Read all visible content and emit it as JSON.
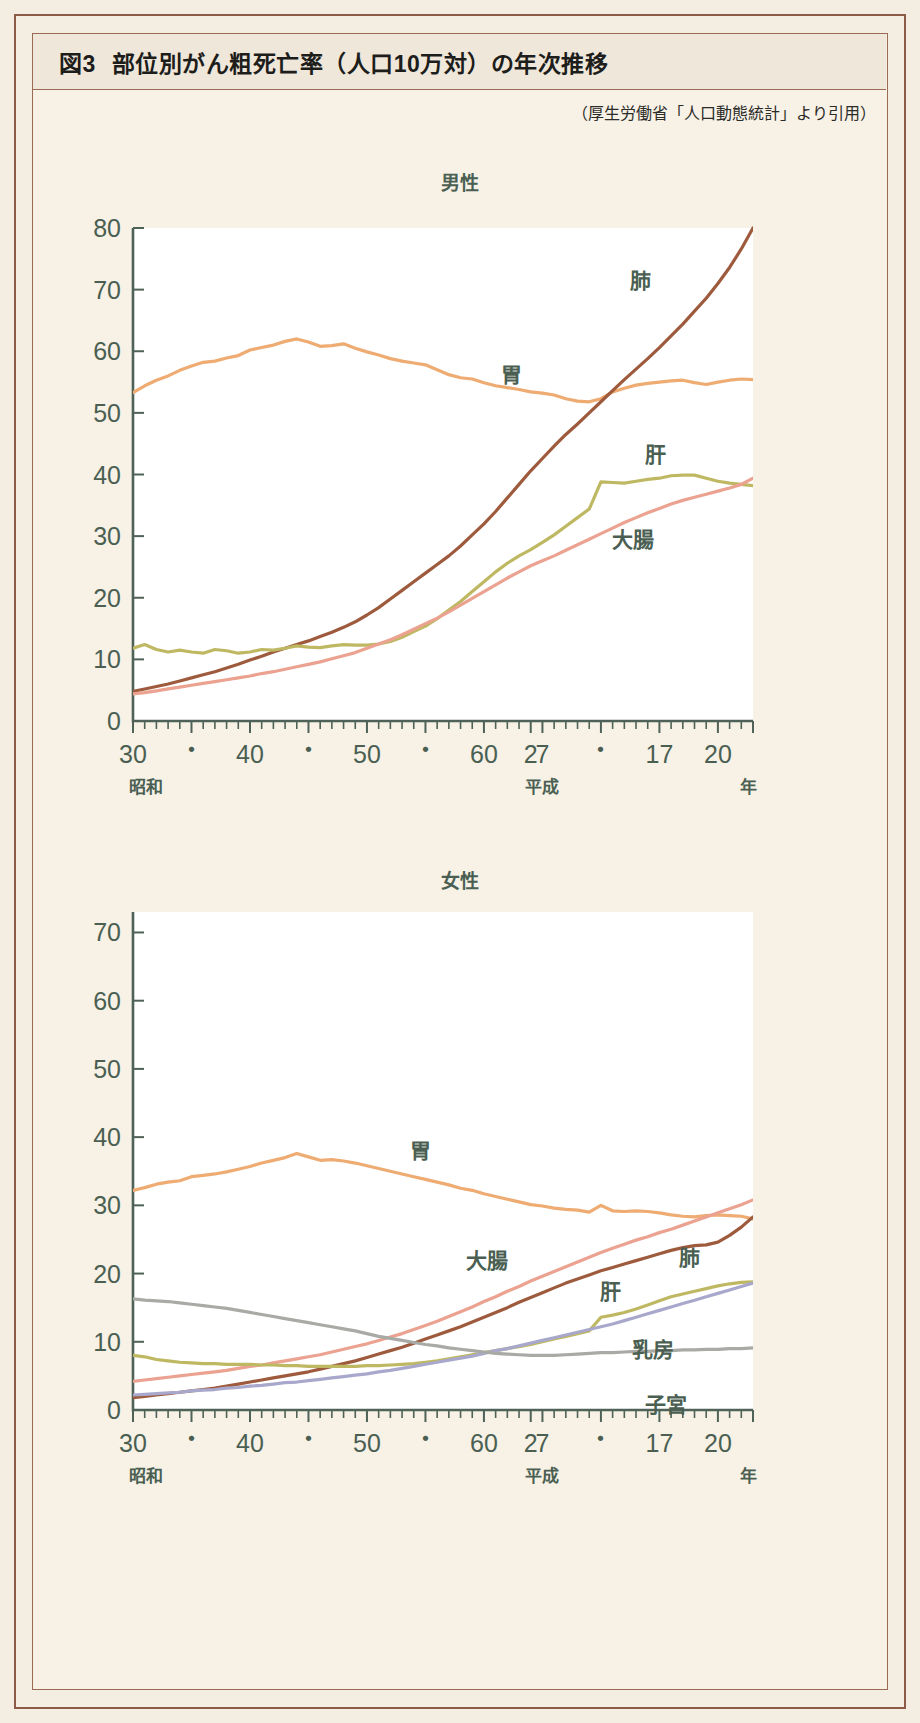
{
  "figure": {
    "number_label": "図3",
    "title": "部位別がん粗死亡率（人口10万対）の年次推移",
    "source": "（厚生労働省「人口動態統計」より引用）"
  },
  "panels": {
    "male_heading": "男性",
    "female_heading": "女性"
  },
  "axis": {
    "era_left": "昭和",
    "era_mid": "平成",
    "unit": "年",
    "xtick_labels": [
      "30",
      "・",
      "40",
      "・",
      "50",
      "・",
      "60",
      "2",
      "7",
      "・",
      "17",
      "20"
    ],
    "male_ytick_labels": [
      "0",
      "10",
      "20",
      "30",
      "40",
      "50",
      "60",
      "70",
      "80"
    ],
    "female_ytick_labels": [
      "0",
      "10",
      "20",
      "30",
      "40",
      "50",
      "60",
      "70"
    ]
  },
  "colors": {
    "lung": "#9e5a3c",
    "stomach": "#eeab72",
    "liver": "#bfb863",
    "colon": "#eba290",
    "breast": "#a8a8cc",
    "uterus": "#a8aaa6",
    "axis": "#4f6257",
    "frame": "#9a6a52",
    "page_bg": "#f3ede2",
    "panel_bg": "#f7f1e6",
    "plot_bg": "#ffffff"
  },
  "chart_data": [
    {
      "type": "line",
      "title": "男性",
      "xlabel": "年",
      "ylabel": "",
      "xlim": [
        30,
        83
      ],
      "ylim": [
        0,
        80
      ],
      "x_note": "昭和30年(1955)〜平成20年(2008); x values are sequential years 30..83 where 64=昭和64/平成1",
      "grid": false,
      "legend": "inline-labels",
      "x": [
        30,
        31,
        32,
        33,
        34,
        35,
        36,
        37,
        38,
        39,
        40,
        41,
        42,
        43,
        44,
        45,
        46,
        47,
        48,
        49,
        50,
        51,
        52,
        53,
        54,
        55,
        56,
        57,
        58,
        59,
        60,
        61,
        62,
        63,
        64,
        65,
        66,
        67,
        68,
        69,
        70,
        71,
        72,
        73,
        74,
        75,
        76,
        77,
        78,
        79,
        80,
        81,
        82,
        83
      ],
      "x_tick_values": [
        30,
        35,
        40,
        45,
        50,
        55,
        60,
        64,
        65,
        70,
        75,
        80,
        83
      ],
      "series": [
        {
          "name": "胃",
          "label": "胃",
          "color": "#eeab72",
          "values": [
            53.3,
            54.4,
            55.3,
            56.0,
            56.9,
            57.6,
            58.2,
            58.4,
            58.9,
            59.3,
            60.2,
            60.6,
            61.0,
            61.6,
            62.0,
            61.5,
            60.8,
            60.9,
            61.2,
            60.5,
            59.9,
            59.4,
            58.8,
            58.4,
            58.1,
            57.8,
            57.0,
            56.2,
            55.7,
            55.5,
            54.9,
            54.4,
            54.1,
            53.8,
            53.4,
            53.2,
            52.9,
            52.3,
            51.9,
            51.8,
            52.3,
            53.4,
            54.0,
            54.5,
            54.8,
            55.0,
            55.2,
            55.3,
            54.9,
            54.6,
            55.0,
            55.3,
            55.5,
            55.4
          ]
        },
        {
          "name": "肺",
          "label": "肺",
          "color": "#9e5a3c",
          "values": [
            4.8,
            5.2,
            5.6,
            6.0,
            6.5,
            7.0,
            7.5,
            8.0,
            8.6,
            9.2,
            9.9,
            10.5,
            11.2,
            11.8,
            12.4,
            13.0,
            13.7,
            14.4,
            15.2,
            16.1,
            17.2,
            18.4,
            19.8,
            21.2,
            22.6,
            24.0,
            25.4,
            26.8,
            28.4,
            30.2,
            32.0,
            34.0,
            36.2,
            38.4,
            40.6,
            42.6,
            44.6,
            46.5,
            48.2,
            50.0,
            51.8,
            53.6,
            55.4,
            57.1,
            58.8,
            60.6,
            62.5,
            64.4,
            66.5,
            68.6,
            71.0,
            73.6,
            76.6,
            80.0
          ]
        },
        {
          "name": "肝",
          "label": "肝",
          "color": "#bfb863",
          "values": [
            11.8,
            12.4,
            11.6,
            11.2,
            11.5,
            11.2,
            11.0,
            11.6,
            11.4,
            11.0,
            11.2,
            11.6,
            11.5,
            11.8,
            12.2,
            12.0,
            11.9,
            12.2,
            12.4,
            12.3,
            12.3,
            12.5,
            12.9,
            13.6,
            14.5,
            15.4,
            16.6,
            18.0,
            19.4,
            21.0,
            22.6,
            24.2,
            25.6,
            26.8,
            27.8,
            29.0,
            30.2,
            31.6,
            33.0,
            34.4,
            38.8,
            38.7,
            38.6,
            38.9,
            39.2,
            39.4,
            39.8,
            39.9,
            39.9,
            39.4,
            38.9,
            38.6,
            38.4,
            38.2
          ]
        },
        {
          "name": "大腸",
          "label": "大腸",
          "color": "#eba290",
          "values": [
            4.4,
            4.6,
            4.9,
            5.2,
            5.5,
            5.8,
            6.1,
            6.4,
            6.7,
            7.0,
            7.3,
            7.7,
            8.0,
            8.4,
            8.8,
            9.2,
            9.6,
            10.1,
            10.6,
            11.1,
            11.8,
            12.5,
            13.2,
            14.0,
            14.9,
            15.8,
            16.7,
            17.7,
            18.8,
            19.9,
            21.0,
            22.1,
            23.2,
            24.2,
            25.2,
            26.0,
            26.8,
            27.7,
            28.6,
            29.5,
            30.4,
            31.3,
            32.2,
            33.0,
            33.8,
            34.5,
            35.2,
            35.8,
            36.3,
            36.8,
            37.3,
            37.8,
            38.4,
            39.4
          ]
        }
      ]
    },
    {
      "type": "line",
      "title": "女性",
      "xlabel": "年",
      "ylabel": "",
      "xlim": [
        30,
        83
      ],
      "ylim": [
        0,
        73
      ],
      "x_note": "昭和30年(1955)〜平成20年(2008)",
      "grid": false,
      "legend": "inline-labels",
      "x": [
        30,
        31,
        32,
        33,
        34,
        35,
        36,
        37,
        38,
        39,
        40,
        41,
        42,
        43,
        44,
        45,
        46,
        47,
        48,
        49,
        50,
        51,
        52,
        53,
        54,
        55,
        56,
        57,
        58,
        59,
        60,
        61,
        62,
        63,
        64,
        65,
        66,
        67,
        68,
        69,
        70,
        71,
        72,
        73,
        74,
        75,
        76,
        77,
        78,
        79,
        80,
        81,
        82,
        83
      ],
      "x_tick_values": [
        30,
        35,
        40,
        45,
        50,
        55,
        60,
        64,
        65,
        70,
        75,
        80,
        83
      ],
      "series": [
        {
          "name": "胃",
          "label": "胃",
          "color": "#eeab72",
          "values": [
            32.2,
            32.6,
            33.1,
            33.4,
            33.6,
            34.2,
            34.4,
            34.6,
            34.9,
            35.3,
            35.7,
            36.2,
            36.6,
            37.0,
            37.6,
            37.1,
            36.6,
            36.7,
            36.5,
            36.2,
            35.8,
            35.4,
            35.0,
            34.6,
            34.2,
            33.8,
            33.4,
            33.0,
            32.5,
            32.2,
            31.7,
            31.3,
            30.9,
            30.5,
            30.1,
            29.9,
            29.6,
            29.4,
            29.3,
            29.0,
            30.0,
            29.2,
            29.1,
            29.2,
            29.1,
            28.9,
            28.6,
            28.4,
            28.3,
            28.5,
            28.6,
            28.5,
            28.4,
            28.0
          ]
        },
        {
          "name": "大腸",
          "label": "大腸",
          "color": "#eba290",
          "values": [
            4.2,
            4.4,
            4.6,
            4.8,
            5.0,
            5.2,
            5.4,
            5.6,
            5.8,
            6.1,
            6.4,
            6.6,
            6.9,
            7.2,
            7.5,
            7.8,
            8.1,
            8.5,
            8.9,
            9.3,
            9.7,
            10.2,
            10.7,
            11.2,
            11.8,
            12.4,
            13.0,
            13.7,
            14.4,
            15.1,
            15.9,
            16.6,
            17.4,
            18.1,
            18.9,
            19.6,
            20.3,
            21.0,
            21.7,
            22.4,
            23.1,
            23.7,
            24.3,
            24.9,
            25.4,
            26.0,
            26.5,
            27.1,
            27.7,
            28.3,
            28.9,
            29.5,
            30.1,
            30.8
          ]
        },
        {
          "name": "肺",
          "label": "肺",
          "color": "#9e5a3c",
          "values": [
            1.8,
            2.0,
            2.2,
            2.4,
            2.6,
            2.8,
            3.0,
            3.2,
            3.5,
            3.8,
            4.1,
            4.4,
            4.7,
            5.0,
            5.3,
            5.6,
            6.0,
            6.4,
            6.8,
            7.2,
            7.7,
            8.2,
            8.7,
            9.2,
            9.8,
            10.4,
            11.0,
            11.6,
            12.2,
            12.9,
            13.6,
            14.3,
            15.0,
            15.8,
            16.5,
            17.2,
            17.9,
            18.6,
            19.2,
            19.8,
            20.4,
            20.9,
            21.4,
            21.9,
            22.4,
            22.9,
            23.4,
            23.8,
            24.1,
            24.2,
            24.6,
            25.6,
            26.8,
            28.3
          ]
        },
        {
          "name": "肝",
          "label": "肝",
          "color": "#bfb863",
          "values": [
            8.0,
            7.8,
            7.4,
            7.2,
            7.0,
            6.9,
            6.8,
            6.8,
            6.7,
            6.7,
            6.7,
            6.6,
            6.6,
            6.5,
            6.5,
            6.4,
            6.4,
            6.4,
            6.4,
            6.4,
            6.5,
            6.5,
            6.6,
            6.7,
            6.8,
            7.0,
            7.2,
            7.5,
            7.8,
            8.1,
            8.4,
            8.7,
            9.0,
            9.3,
            9.6,
            10.0,
            10.4,
            10.8,
            11.2,
            11.6,
            13.6,
            13.9,
            14.3,
            14.8,
            15.4,
            16.0,
            16.6,
            17.0,
            17.4,
            17.8,
            18.2,
            18.5,
            18.7,
            18.8
          ]
        },
        {
          "name": "乳房",
          "label": "乳房",
          "color": "#a8a8cc",
          "values": [
            2.2,
            2.3,
            2.4,
            2.5,
            2.6,
            2.8,
            2.9,
            3.0,
            3.2,
            3.3,
            3.5,
            3.6,
            3.8,
            4.0,
            4.1,
            4.3,
            4.5,
            4.7,
            4.9,
            5.1,
            5.3,
            5.6,
            5.8,
            6.1,
            6.4,
            6.7,
            7.0,
            7.3,
            7.6,
            7.9,
            8.3,
            8.7,
            9.0,
            9.4,
            9.8,
            10.2,
            10.6,
            11.0,
            11.4,
            11.8,
            12.2,
            12.6,
            13.1,
            13.6,
            14.1,
            14.6,
            15.1,
            15.6,
            16.1,
            16.6,
            17.1,
            17.6,
            18.1,
            18.6
          ]
        },
        {
          "name": "子宮",
          "label": "子宮",
          "color": "#a8aaa6",
          "values": [
            16.3,
            16.1,
            16.0,
            15.9,
            15.7,
            15.5,
            15.3,
            15.1,
            14.9,
            14.6,
            14.3,
            14.0,
            13.7,
            13.4,
            13.1,
            12.8,
            12.5,
            12.2,
            11.9,
            11.6,
            11.2,
            10.8,
            10.5,
            10.2,
            9.9,
            9.6,
            9.4,
            9.1,
            8.9,
            8.7,
            8.5,
            8.3,
            8.2,
            8.1,
            8.0,
            8.0,
            8.0,
            8.1,
            8.2,
            8.3,
            8.4,
            8.4,
            8.5,
            8.6,
            8.6,
            8.7,
            8.7,
            8.8,
            8.8,
            8.9,
            8.9,
            9.0,
            9.0,
            9.1
          ]
        }
      ]
    }
  ],
  "series_label_positions": {
    "male": [
      {
        "name": "肺",
        "x": 640,
        "y": 288
      },
      {
        "name": "胃",
        "x": 511,
        "y": 382
      },
      {
        "name": "肝",
        "x": 655,
        "y": 462
      },
      {
        "name": "大腸",
        "x": 633,
        "y": 547
      }
    ],
    "female": [
      {
        "name": "胃",
        "x": 420,
        "y": 1158
      },
      {
        "name": "大腸",
        "x": 487,
        "y": 1268
      },
      {
        "name": "肺",
        "x": 689,
        "y": 1265
      },
      {
        "name": "肝",
        "x": 610,
        "y": 1299
      },
      {
        "name": "乳房",
        "x": 653,
        "y": 1357
      },
      {
        "name": "子宮",
        "x": 666,
        "y": 1412
      }
    ]
  }
}
